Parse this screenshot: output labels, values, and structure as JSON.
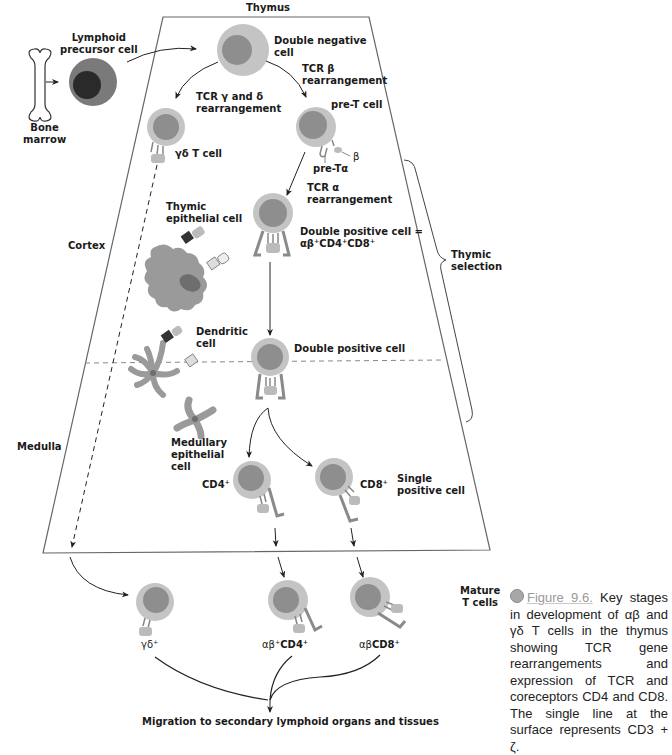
{
  "diagram": {
    "title": "Thymus",
    "regions": {
      "cortex": "Cortex",
      "medulla": "Medulla"
    },
    "bone_marrow": {
      "label_line1": "Bone",
      "label_line2": "marrow"
    },
    "cells": {
      "lymphoid_precursor": {
        "line1": "Lymphoid",
        "line2": "precursor cell"
      },
      "double_negative": {
        "line1": "Double negative",
        "line2": "cell"
      },
      "gd_t_cell": {
        "label": "γδ T cell"
      },
      "pre_t_cell": {
        "label": "pre-T cell",
        "pre_t_alpha": "pre-Tα",
        "beta": "β"
      },
      "double_positive_cortex": {
        "line1": "Double positive cell =",
        "line2": "αβ⁺CD4⁺CD8⁺"
      },
      "thymic_epithelial": {
        "line1": "Thymic",
        "line2": "epithelial cell"
      },
      "dendritic": {
        "line1": "Dendritic",
        "line2": "cell"
      },
      "double_positive_medulla": {
        "label": "Double positive cell"
      },
      "medullary_epithelial": {
        "line1": "Medullary",
        "line2": "epithelial",
        "line3": "cell"
      },
      "cd4_single": {
        "label": "CD4⁺"
      },
      "cd8_single": {
        "label": "CD8⁺"
      },
      "single_positive": {
        "line1": "Single",
        "line2": "positive cell"
      },
      "mature_gd": {
        "label": "γδ⁺"
      },
      "mature_ab_cd4": {
        "prefix": "αβ⁺",
        "label": "CD4⁺"
      },
      "mature_ab_cd8": {
        "prefix": "αβ",
        "label": "CD8⁺"
      }
    },
    "steps": {
      "tcr_gd": {
        "line1": "TCR γ and δ",
        "line2": "rearrangement"
      },
      "tcr_b": {
        "line1": "TCR β",
        "line2": "rearrangement"
      },
      "tcr_a": {
        "line1": "TCR α",
        "line2": "rearrangement"
      }
    },
    "thymic_selection": {
      "line1": "Thymic",
      "line2": "selection"
    },
    "mature_t_cells": {
      "line1": "Mature",
      "line2": "T cells"
    },
    "migration": "Migration to secondary lymphoid organs and tissues",
    "colors": {
      "cell_outer": "#c4c4c4",
      "cell_nucleus": "#8e8e8e",
      "precursor_outer": "#7a7a7a",
      "precursor_nucleus": "#2a2a2a",
      "stroma": "#9a9a9a",
      "receptor_dark": "#3a3a3a",
      "line": "#555555"
    }
  },
  "caption": {
    "figure_ref": "Figure 9.6.",
    "text": " Key stages in development of αβ and γδ T cells in the thymus showing TCR gene rearrangements and expression of TCR and coreceptors CD4 and CD8. The single line at the surface represents CD3 + ζ."
  }
}
